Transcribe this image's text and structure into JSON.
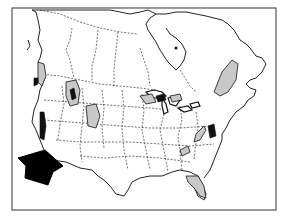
{
  "map": {
    "subject": "North America (United States and Canada) outline map",
    "style": "black and white line map",
    "frame": {
      "x": 12,
      "y": 8,
      "width": 264,
      "height": 202,
      "stroke": "#555555"
    },
    "colors": {
      "background": "#ffffff",
      "outline": "#222222",
      "shaded_region": "#c8c8c8",
      "dark_region": "#111111",
      "arrow": "#000000"
    },
    "features": {
      "arrow": {
        "points_to": "Southern California",
        "direction": "up-right"
      },
      "shaded_regions": [
        "Pacific Northwest coast",
        "Northern Rockies (Idaho/Montana)",
        "Wasatch / Utah",
        "Colorado Rockies",
        "Great Lakes region",
        "New England / Northern Appalachians",
        "Southern Appalachians",
        "Central Appalachians",
        "Florida"
      ],
      "dark_regions": [
        "California Sierra Nevada",
        "Northwest coast",
        "Mid-Atlantic coast"
      ]
    }
  }
}
